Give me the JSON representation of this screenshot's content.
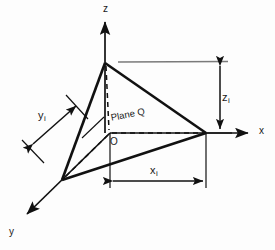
{
  "figure": {
    "background_color": "#fdfdfd",
    "line_color": "#111111",
    "gray_line_color": "#7a7a7a"
  },
  "axes": {
    "z_label": "z",
    "x_label": "x",
    "y_label": "y"
  },
  "plane": {
    "label": "Plane Q"
  },
  "origin": {
    "label": "O"
  },
  "dimensions": {
    "z_intercept": {
      "symbol": "z",
      "subscript": "i"
    },
    "x_intercept": {
      "symbol": "x",
      "subscript": "i"
    },
    "y_intercept": {
      "symbol": "y",
      "subscript": "i"
    }
  },
  "geometry": {
    "origin_point": [
      110,
      133
    ],
    "z_vertex": [
      105,
      63
    ],
    "x_vertex": [
      206,
      133
    ],
    "y_vertex": [
      62,
      180
    ],
    "z_axis_tip": [
      105,
      18
    ],
    "x_axis_tip": [
      252,
      133
    ],
    "y_axis_tip": [
      23,
      218
    ]
  }
}
